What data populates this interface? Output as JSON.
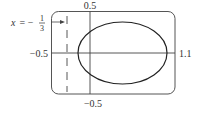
{
  "figure": {
    "type": "graphing-calculator-view",
    "window": {
      "x_min": -0.5,
      "x_max": 1.1,
      "y_min": -0.5,
      "y_max": 0.5
    },
    "labels": {
      "x_max": "1.1",
      "x_min": "−0.5",
      "y_max": "0.5",
      "y_min": "−0.5"
    },
    "asymptote": {
      "var": "x",
      "equals": " = −",
      "num": "1",
      "den": "3",
      "value": -0.3333
    },
    "curve": {
      "shape": "ellipse",
      "center": [
        0.3,
        0.0
      ],
      "semi_x": 0.4,
      "semi_y": 0.4
    }
  }
}
